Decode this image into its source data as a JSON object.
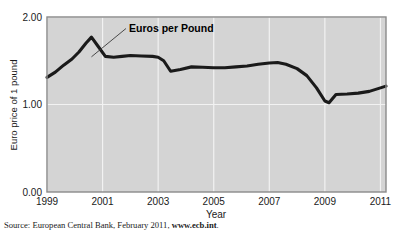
{
  "figure": {
    "source_prefix": "Source: European Central Bank, February 2011, ",
    "source_link": "www.ecb.int",
    "source_suffix": ".",
    "annotation": "Euros per Pound"
  },
  "colors": {
    "plot_background": "#d4d4d4",
    "gridline": "#f2f2f2",
    "line": "#1a1a1a",
    "border": "#8a8a8a",
    "text": "#1a1a1a",
    "page_background": "#ffffff"
  },
  "chart_data": {
    "type": "line",
    "title": "",
    "xlabel": "Year",
    "ylabel": "Euro price of 1 pound",
    "xlim": [
      1999,
      2011.2
    ],
    "ylim": [
      0.0,
      2.0
    ],
    "xticks": [
      1999,
      2001,
      2003,
      2005,
      2007,
      2009,
      2011
    ],
    "xtick_labels": [
      "1999",
      "2001",
      "2003",
      "2005",
      "2007",
      "2009",
      "2011"
    ],
    "yticks": [
      0.0,
      1.0,
      2.0
    ],
    "ytick_labels": [
      "0.00",
      "1.00",
      "2.00"
    ],
    "grid": true,
    "legend": "none",
    "annotations": [
      {
        "text": "Euros per Pound",
        "x": 2001.95,
        "y": 1.88,
        "leader_to_x": 2000.6,
        "leader_to_y": 1.545
      }
    ],
    "series": [
      {
        "name": "Euros per Pound",
        "x": [
          1999.0,
          1999.3,
          1999.6,
          1999.9,
          2000.15,
          2000.4,
          2000.6,
          2000.85,
          2001.1,
          2001.4,
          2001.7,
          2002.0,
          2002.4,
          2002.8,
          2003.0,
          2003.2,
          2003.45,
          2003.8,
          2004.2,
          2004.6,
          2005.0,
          2005.4,
          2005.8,
          2006.2,
          2006.6,
          2007.0,
          2007.3,
          2007.6,
          2008.0,
          2008.35,
          2008.7,
          2009.0,
          2009.15,
          2009.4,
          2009.8,
          2010.2,
          2010.6,
          2011.0,
          2011.2
        ],
        "y": [
          1.31,
          1.37,
          1.45,
          1.52,
          1.6,
          1.7,
          1.77,
          1.66,
          1.55,
          1.54,
          1.55,
          1.56,
          1.555,
          1.55,
          1.54,
          1.5,
          1.38,
          1.4,
          1.43,
          1.425,
          1.42,
          1.42,
          1.43,
          1.44,
          1.46,
          1.475,
          1.48,
          1.46,
          1.41,
          1.33,
          1.19,
          1.04,
          1.02,
          1.115,
          1.12,
          1.13,
          1.15,
          1.19,
          1.21
        ]
      }
    ]
  }
}
